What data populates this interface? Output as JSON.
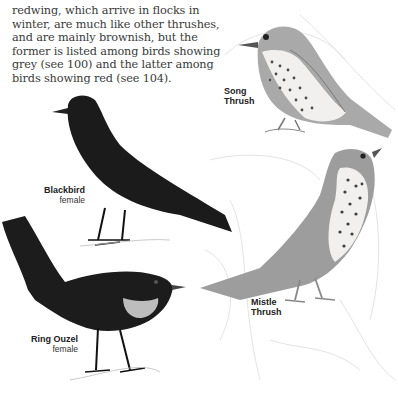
{
  "page": {
    "body_text_lines": [
      "redwing, which arrive in flocks in",
      "winter, are much like other thrushes,",
      "and are mainly brownish, but the",
      "former is listed among birds showing",
      "grey (see 100) and the latter among",
      "birds showing red (see 104)."
    ]
  },
  "illustrations": [
    {
      "id": "song-thrush",
      "label_line1": "Song",
      "label_line2": "Thrush"
    },
    {
      "id": "blackbird",
      "label_line1": "Blackbird",
      "label_line2": "female"
    },
    {
      "id": "ring-ouzel",
      "label_line1": "Ring Ouzel",
      "label_line2": "female"
    },
    {
      "id": "mistle-thrush",
      "label_line1": "Mistle",
      "label_line2": "Thrush"
    }
  ],
  "colors": {
    "text": "#3a3a3a",
    "dark_bird": "#1a1a1a",
    "thrush_grey": "#9a9a9a",
    "sketch": "#d8d8d8"
  }
}
